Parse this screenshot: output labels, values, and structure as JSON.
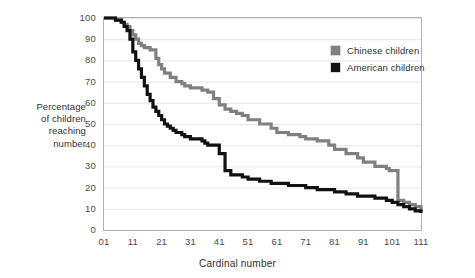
{
  "chart_data": {
    "type": "line",
    "title": "",
    "xlabel": "Cardinal number",
    "ylabel": "Percentage of children reaching number",
    "ylabel_lines": [
      "Percentage",
      "of children",
      "reaching",
      "number"
    ],
    "xlim": [
      1,
      111
    ],
    "ylim": [
      0,
      100
    ],
    "xticks": [
      "01",
      "11",
      "21",
      "31",
      "41",
      "51",
      "61",
      "71",
      "81",
      "91",
      "101",
      "111"
    ],
    "xtick_values": [
      1,
      11,
      21,
      31,
      41,
      51,
      61,
      71,
      81,
      91,
      101,
      111
    ],
    "yticks": [
      "0",
      "10",
      "20",
      "30",
      "40",
      "50",
      "60",
      "70",
      "80",
      "90",
      "100"
    ],
    "ytick_values": [
      0,
      10,
      20,
      30,
      40,
      50,
      60,
      70,
      80,
      90,
      100
    ],
    "grid": true,
    "grid_axis": "y",
    "legend_position": "top-right",
    "line_style": "step",
    "series": [
      {
        "name": "Chinese children",
        "color": "#808080",
        "x": [
          1,
          3,
          5,
          7,
          8,
          9,
          10,
          11,
          12,
          13,
          14,
          15,
          16,
          17,
          18,
          19,
          20,
          21,
          22,
          24,
          26,
          28,
          29,
          30,
          31,
          33,
          35,
          37,
          39,
          41,
          43,
          45,
          47,
          49,
          51,
          55,
          59,
          61,
          65,
          69,
          71,
          75,
          79,
          81,
          85,
          89,
          91,
          95,
          99,
          100,
          101,
          103,
          105,
          107,
          109,
          111
        ],
        "y": [
          100,
          100,
          99,
          98,
          97,
          96,
          94,
          92,
          90,
          88,
          87,
          86,
          86,
          85,
          85,
          81,
          78,
          76,
          74,
          72,
          70,
          69,
          68,
          68,
          67,
          67,
          66,
          65,
          62,
          59,
          57,
          56,
          55,
          54,
          52,
          50,
          48,
          46,
          45,
          44,
          43,
          42,
          40,
          38,
          36,
          34,
          32,
          30,
          29,
          28,
          28,
          14,
          13,
          12,
          11,
          9
        ]
      },
      {
        "name": "American children",
        "color": "#111111",
        "x": [
          1,
          3,
          5,
          7,
          8,
          9,
          10,
          11,
          12,
          13,
          14,
          15,
          16,
          17,
          18,
          19,
          20,
          21,
          22,
          23,
          24,
          25,
          26,
          27,
          28,
          29,
          30,
          31,
          33,
          35,
          36,
          37,
          38,
          39,
          41,
          43,
          45,
          47,
          49,
          51,
          55,
          59,
          61,
          65,
          69,
          71,
          75,
          79,
          81,
          85,
          89,
          91,
          95,
          99,
          101,
          103,
          105,
          107,
          109,
          111
        ],
        "y": [
          100,
          100,
          99,
          98,
          96,
          94,
          90,
          84,
          80,
          76,
          72,
          68,
          64,
          61,
          58,
          56,
          54,
          52,
          50,
          49,
          48,
          47,
          46,
          46,
          45,
          44,
          44,
          43,
          43,
          42,
          41,
          40,
          40,
          40,
          36,
          28,
          26,
          26,
          25,
          24,
          23,
          22,
          22,
          21,
          21,
          20,
          19,
          19,
          18,
          17,
          16,
          16,
          15,
          14,
          13,
          12,
          11,
          10,
          9,
          8
        ]
      }
    ]
  },
  "legend": {
    "items": [
      {
        "label": "Chinese children",
        "color": "#808080"
      },
      {
        "label": "American children",
        "color": "#111111"
      }
    ]
  }
}
